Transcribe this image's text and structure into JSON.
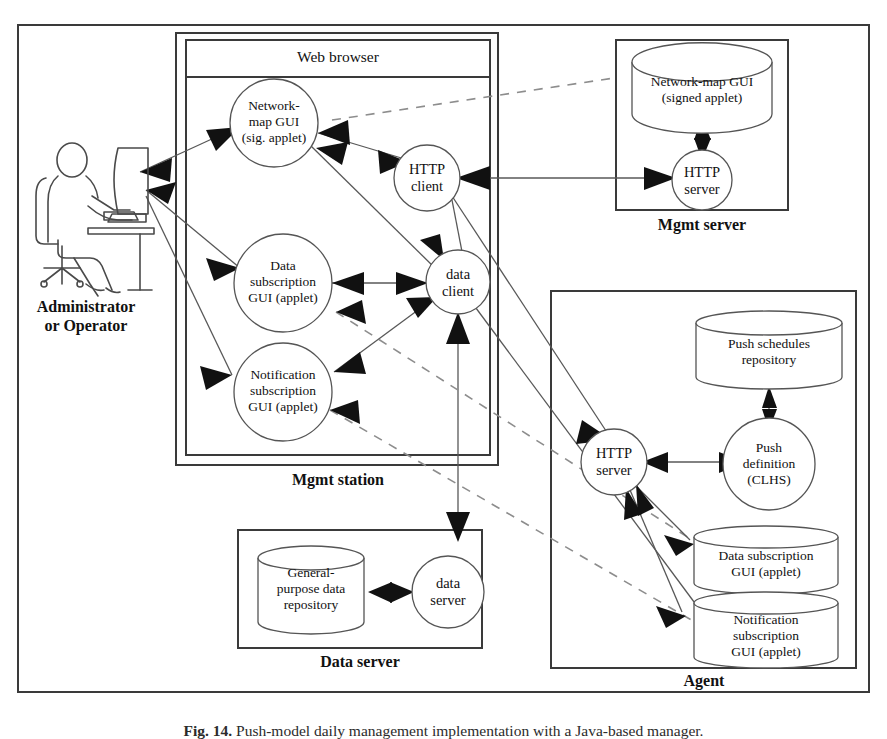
{
  "figure": {
    "caption_label": "Fig. 14.",
    "caption_text": "Push-model daily management implementation with a Java-based manager.",
    "outer_border_color": "#3a3a3a"
  },
  "actor": {
    "label_line1": "Administrator",
    "label_line2": "or Operator",
    "icon": "person-at-desk-icon"
  },
  "mgmt_station": {
    "title": "Mgmt station",
    "browser_title": "Web browser",
    "nodes": [
      {
        "id": "network-map-gui",
        "shape": "circle",
        "lines": [
          "Network-",
          "map GUI",
          "(sig. applet)"
        ]
      },
      {
        "id": "http-client",
        "shape": "circle",
        "lines": [
          "HTTP",
          "client"
        ]
      },
      {
        "id": "data-subscription-gui",
        "shape": "circle",
        "lines": [
          "Data",
          "subscription",
          "GUI (applet)"
        ]
      },
      {
        "id": "data-client",
        "shape": "circle",
        "lines": [
          "data",
          "client"
        ]
      },
      {
        "id": "notification-subscription-gui",
        "shape": "circle",
        "lines": [
          "Notification",
          "subscription",
          "GUI (applet)"
        ]
      }
    ]
  },
  "mgmt_server": {
    "title": "Mgmt server",
    "nodes": [
      {
        "id": "network-map-gui-repo",
        "shape": "cylinder",
        "lines": [
          "Network-map GUI",
          "(signed applet)"
        ]
      },
      {
        "id": "mgmt-http-server",
        "shape": "circle",
        "lines": [
          "HTTP",
          "server"
        ]
      }
    ]
  },
  "data_server": {
    "title": "Data server",
    "nodes": [
      {
        "id": "general-purpose-data-repository",
        "shape": "cylinder",
        "lines": [
          "General-",
          "purpose data",
          "repository"
        ]
      },
      {
        "id": "data-server-node",
        "shape": "circle",
        "lines": [
          "data",
          "server"
        ]
      }
    ]
  },
  "agent": {
    "title": "Agent",
    "nodes": [
      {
        "id": "push-schedules-repository",
        "shape": "cylinder",
        "lines": [
          "Push schedules",
          "repository"
        ]
      },
      {
        "id": "agent-http-server",
        "shape": "circle",
        "lines": [
          "HTTP",
          "server"
        ]
      },
      {
        "id": "push-definition",
        "shape": "circle",
        "lines": [
          "Push",
          "definition",
          "(CLHS)"
        ]
      },
      {
        "id": "agent-data-subscription-gui",
        "shape": "cylinder",
        "lines": [
          "Data subscription",
          "GUI (applet)"
        ]
      },
      {
        "id": "agent-notification-subscription-gui",
        "shape": "cylinder",
        "lines": [
          "Notification",
          "subscription",
          "GUI (applet)"
        ]
      }
    ]
  }
}
